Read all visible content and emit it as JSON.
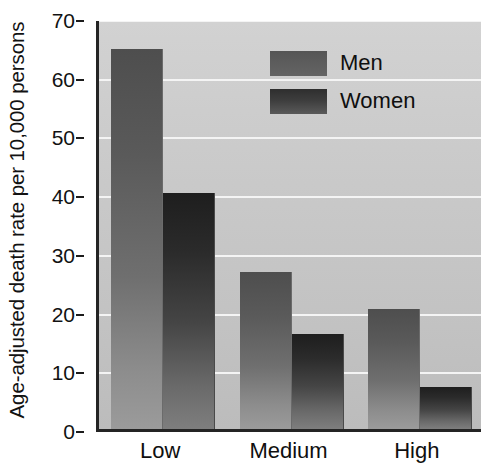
{
  "chart_data": {
    "type": "bar",
    "title": "",
    "xlabel": "",
    "ylabel": "Age-adjusted death rate per 10,000 persons",
    "categories": [
      "Low",
      "Medium",
      "High"
    ],
    "series": [
      {
        "name": "Men",
        "values": [
          64.8,
          26.7,
          20.4
        ]
      },
      {
        "name": "Women",
        "values": [
          40.2,
          16.1,
          7.1
        ]
      }
    ],
    "ylim": [
      0,
      70
    ],
    "yticks": [
      0,
      10,
      20,
      30,
      40,
      50,
      60,
      70
    ],
    "ytick_labels": [
      "0",
      "10",
      "20",
      "30",
      "40",
      "50",
      "60",
      "70"
    ],
    "grid": true,
    "grid_orientation": "horizontal",
    "legend": {
      "position": "top-right",
      "entries": [
        "Men",
        "Women"
      ]
    },
    "colors": {
      "men": "#5a5a5a",
      "women": "#2b2b2b",
      "plot_background": "#c9c9c9",
      "gridline": "#f4f4f4",
      "axis": "#242424",
      "text": "#121212"
    }
  }
}
